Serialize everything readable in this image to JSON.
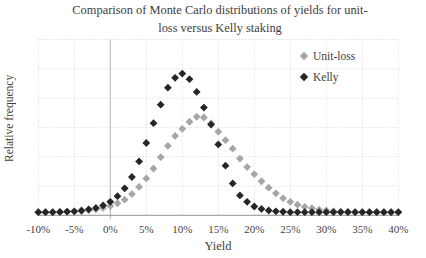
{
  "title": {
    "lines": [
      "Comparison of Monte Carlo distributions of yields for unit-",
      "loss versus Kelly staking"
    ]
  },
  "axes": {
    "x_label": "Yield",
    "y_label": "Relative frequency",
    "x_ticks": [
      "-10%",
      "-5%",
      "0%",
      "5%",
      "10%",
      "15%",
      "20%",
      "25%",
      "30%",
      "35%",
      "40%"
    ]
  },
  "legend": {
    "items": [
      {
        "label": "Unit-loss",
        "color": "#a6a6a6"
      },
      {
        "label": "Kelly",
        "color": "#262626"
      }
    ]
  },
  "colors": {
    "gridline": "#d4d4d4",
    "axis_line": "#909090",
    "zero_line": "#b4b4b4",
    "unit_loss_marker": "#a6a6a6",
    "kelly_marker": "#262626"
  },
  "chart_data": {
    "type": "scatter",
    "xlabel": "Yield",
    "ylabel": "Relative frequency",
    "x_tick_labels": [
      "-10%",
      "-5%",
      "0%",
      "5%",
      "10%",
      "15%",
      "20%",
      "25%",
      "30%",
      "35%",
      "40%"
    ],
    "x": [
      -10,
      -9,
      -8,
      -7,
      -6,
      -5,
      -4,
      -3,
      -2,
      -1,
      0,
      1,
      2,
      3,
      4,
      5,
      6,
      7,
      8,
      9,
      10,
      11,
      12,
      13,
      14,
      15,
      16,
      17,
      18,
      19,
      20,
      21,
      22,
      23,
      24,
      25,
      26,
      27,
      28,
      29,
      30,
      31,
      32,
      33,
      34,
      35,
      36,
      37,
      38,
      39,
      40
    ],
    "series": [
      {
        "name": "Unit-loss",
        "color": "#a6a6a6",
        "marker": "diamond",
        "values": [
          0.022,
          0.022,
          0.022,
          0.022,
          0.024,
          0.026,
          0.03,
          0.035,
          0.042,
          0.052,
          0.065,
          0.085,
          0.11,
          0.15,
          0.2,
          0.26,
          0.33,
          0.41,
          0.49,
          0.56,
          0.61,
          0.66,
          0.695,
          0.69,
          0.65,
          0.59,
          0.53,
          0.47,
          0.4,
          0.34,
          0.29,
          0.24,
          0.195,
          0.155,
          0.12,
          0.095,
          0.075,
          0.06,
          0.05,
          0.04,
          0.034,
          0.03,
          0.027,
          0.025,
          0.023,
          0.022,
          0.022,
          0.022,
          0.022,
          0.022,
          0.022
        ]
      },
      {
        "name": "Kelly",
        "color": "#262626",
        "marker": "diamond",
        "values": [
          0.022,
          0.022,
          0.022,
          0.024,
          0.026,
          0.028,
          0.034,
          0.042,
          0.052,
          0.07,
          0.095,
          0.135,
          0.19,
          0.27,
          0.38,
          0.51,
          0.65,
          0.78,
          0.9,
          0.97,
          1.0,
          0.96,
          0.87,
          0.76,
          0.64,
          0.5,
          0.35,
          0.225,
          0.14,
          0.095,
          0.062,
          0.045,
          0.034,
          0.028,
          0.025,
          0.022,
          0.022,
          0.022,
          0.022,
          0.022,
          0.022,
          0.022,
          0.022,
          0.022,
          0.022,
          0.022,
          0.022,
          0.022,
          0.022,
          0.022,
          0.022
        ]
      }
    ],
    "xlim": [
      -10,
      40
    ],
    "ylim": [
      0,
      1.24
    ],
    "x_tick_step": 5,
    "grid": true,
    "legend_position": "inside-top-right",
    "y_units": "relative (no y tick labels shown)"
  }
}
